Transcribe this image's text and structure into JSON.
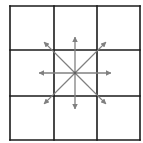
{
  "diagram": {
    "type": "neighborhood-directions",
    "grid": {
      "rows": 3,
      "cols": 3,
      "x": [
        10,
        54,
        97,
        140
      ],
      "y": [
        6,
        50,
        96,
        140
      ],
      "line_color": "#1a1a1a",
      "line_width": 1.6
    },
    "center": {
      "x": 75,
      "y": 73
    },
    "arrow_color": "#808080",
    "arrow_length": 46,
    "arrows": [
      {
        "direction": "north-west",
        "dx": -1,
        "dy": -1
      },
      {
        "direction": "north",
        "dx": 0,
        "dy": -1
      },
      {
        "direction": "north-east",
        "dx": 1,
        "dy": -1
      },
      {
        "direction": "west",
        "dx": -1,
        "dy": 0
      },
      {
        "direction": "east",
        "dx": 1,
        "dy": 0
      },
      {
        "direction": "south-west",
        "dx": -1,
        "dy": 1
      },
      {
        "direction": "south",
        "dx": 0,
        "dy": 1
      },
      {
        "direction": "south-east",
        "dx": 1,
        "dy": 1
      }
    ]
  }
}
